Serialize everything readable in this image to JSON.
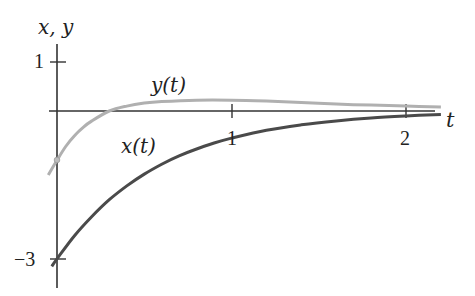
{
  "chart_data": {
    "type": "line",
    "title": "",
    "xlabel": "t",
    "ylabel": "x, y",
    "xlim": [
      -0.05,
      2.2
    ],
    "ylim": [
      -3.2,
      1.3
    ],
    "grid": false,
    "legend": "inline labels",
    "x_ticks": [
      1,
      2
    ],
    "x_tick_labels": [
      "1",
      "2"
    ],
    "y_ticks": [
      1,
      -3
    ],
    "y_tick_labels": [
      "1",
      "−3"
    ],
    "series": [
      {
        "name": "x(t)",
        "color": "#4a4a4a",
        "t": [
          -0.03,
          0,
          0.1,
          0.2,
          0.3,
          0.4,
          0.5,
          0.6,
          0.7,
          0.8,
          0.9,
          1.0,
          1.2,
          1.4,
          1.6,
          1.8,
          2.0,
          2.2
        ],
        "values": [
          -3.15,
          -3.0,
          -2.53,
          -2.14,
          -1.8,
          -1.52,
          -1.28,
          -1.08,
          -0.91,
          -0.77,
          -0.65,
          -0.55,
          -0.39,
          -0.28,
          -0.2,
          -0.14,
          -0.1,
          -0.07
        ]
      },
      {
        "name": "y(t)",
        "color": "#b0b0b0",
        "t": [
          -0.05,
          0,
          0.05,
          0.1,
          0.15,
          0.2,
          0.3,
          0.4,
          0.5,
          0.6,
          0.8,
          1.0,
          1.2,
          1.4,
          1.6,
          1.8,
          2.0,
          2.2
        ],
        "values": [
          -1.3,
          -1.0,
          -0.72,
          -0.5,
          -0.33,
          -0.2,
          0.0,
          0.1,
          0.16,
          0.19,
          0.22,
          0.22,
          0.2,
          0.17,
          0.14,
          0.12,
          0.1,
          0.08
        ]
      }
    ],
    "annotations": [
      {
        "text": "y(t)",
        "t": 0.55,
        "value": 0.45
      },
      {
        "text": "x(t)",
        "t": 0.38,
        "value": -0.75
      }
    ],
    "points": [
      {
        "series": "y(t)",
        "t": 0,
        "value": -1
      },
      {
        "series": "x(t)",
        "t": 0,
        "value": -3
      }
    ]
  },
  "labels": {
    "y_axis": "x, y",
    "x_axis": "t",
    "tick_y_1": "1",
    "tick_y_m3": "−3",
    "tick_x_1": "1",
    "tick_x_2": "2",
    "curve_y": "y(t)",
    "curve_x": "x(t)"
  }
}
